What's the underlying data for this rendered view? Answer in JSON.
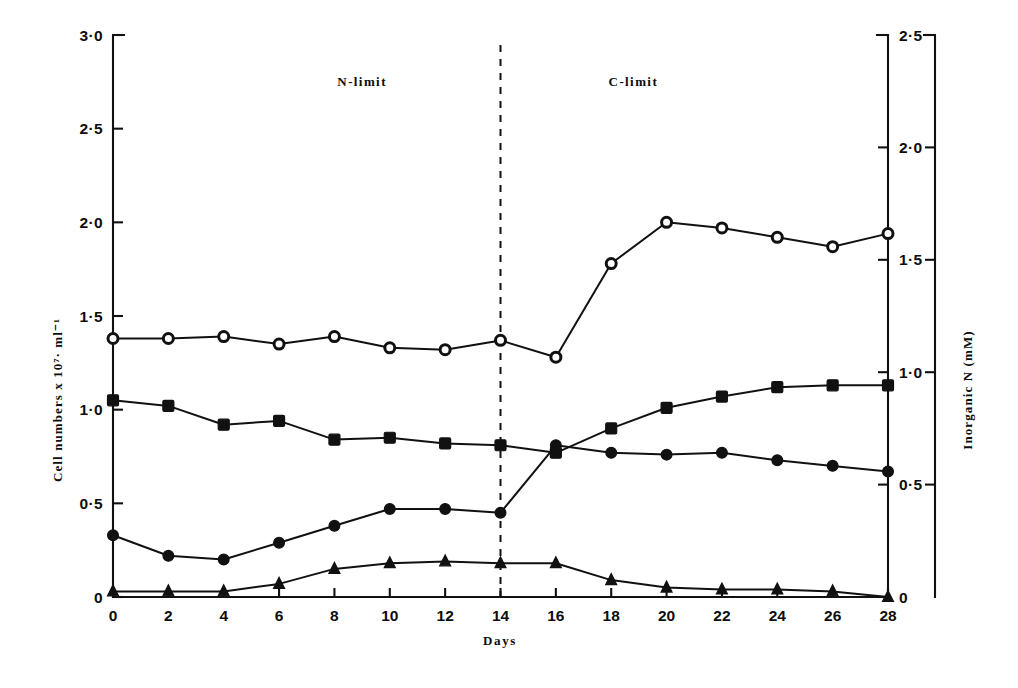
{
  "chart_data": {
    "type": "line",
    "title": "",
    "xlabel": "Days",
    "ylabel": "Cell numbers x 10⁷· ml⁻¹",
    "ylabel_right": "Inorganic N  (mM)",
    "x": [
      0,
      2,
      4,
      6,
      8,
      10,
      12,
      14,
      16,
      18,
      20,
      22,
      24,
      26,
      28
    ],
    "xlim": [
      0,
      28
    ],
    "xticks": [
      "0",
      "2",
      "4",
      "6",
      "8",
      "10",
      "12",
      "14",
      "16",
      "18",
      "20",
      "22",
      "24",
      "26",
      "28"
    ],
    "ylim": [
      0,
      3.0
    ],
    "yticks": [
      "0",
      "0·5",
      "1·0",
      "1·5",
      "2·0",
      "2·5",
      "3·0"
    ],
    "ytick_values": [
      0,
      0.5,
      1.0,
      1.5,
      2.0,
      2.5,
      3.0
    ],
    "ylim_right": [
      0,
      2.5
    ],
    "yticks_right": [
      "0",
      "0·5",
      "1·0",
      "1·5",
      "2·0",
      "2·5"
    ],
    "ytick_values_right": [
      0,
      0.5,
      1.0,
      1.5,
      2.0,
      2.5
    ],
    "grid": false,
    "legend_position": "none",
    "series": [
      {
        "name": "open-circle-series",
        "marker": "open-circle",
        "values": [
          1.38,
          1.38,
          1.39,
          1.35,
          1.39,
          1.33,
          1.32,
          1.37,
          1.28,
          1.78,
          2.0,
          1.97,
          1.92,
          1.87,
          1.94
        ]
      },
      {
        "name": "filled-square-series",
        "marker": "filled-square",
        "values": [
          1.05,
          1.02,
          0.92,
          0.94,
          0.84,
          0.85,
          0.82,
          0.81,
          0.77,
          0.9,
          1.01,
          1.07,
          1.12,
          1.13,
          1.13
        ]
      },
      {
        "name": "filled-circle-series",
        "marker": "filled-circle",
        "values": [
          0.33,
          0.22,
          0.2,
          0.29,
          0.38,
          0.47,
          0.47,
          0.45,
          0.81,
          0.77,
          0.76,
          0.77,
          0.73,
          0.7,
          0.67
        ]
      },
      {
        "name": "filled-triangle-series",
        "marker": "filled-triangle",
        "values": [
          0.03,
          0.03,
          0.03,
          0.07,
          0.15,
          0.18,
          0.19,
          0.18,
          0.18,
          0.09,
          0.05,
          0.04,
          0.04,
          0.03,
          0.0
        ]
      }
    ],
    "annotations": [
      {
        "text": "N-limit",
        "x": 9.0,
        "y": 2.73
      },
      {
        "text": "C-limit",
        "x": 18.8,
        "y": 2.73
      }
    ],
    "divider": {
      "x": 14,
      "style": "dashed",
      "label": "phase-divider-day-14"
    }
  },
  "colors": {
    "ink": "#111111",
    "background": "#ffffff"
  }
}
